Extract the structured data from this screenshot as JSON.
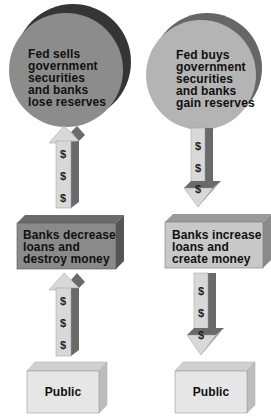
{
  "diagram": {
    "title": "",
    "colors": {
      "left_disc_face": "#8c8c8c",
      "left_disc_rim": "#353535",
      "right_disc_face": "#b4b4b4",
      "right_disc_rim": "#666666",
      "left_box_face": "#8a8a8a",
      "left_box_top": "#6a6a6a",
      "left_box_side": "#555555",
      "right_box_face": "#c8c8c8",
      "right_box_top": "#9a9a9a",
      "right_box_side": "#8a8a8a",
      "public_face": "#e6e6e6",
      "public_top": "#d0d0d0",
      "public_side": "#bdbdbd",
      "arrow_face": "#d4d4d4",
      "arrow_side": "#6a6a6a"
    },
    "left_column": {
      "top": {
        "shape": "disc",
        "lines": [
          "Fed sells",
          "government",
          "securities",
          "and banks",
          "lose reserves"
        ]
      },
      "upper_arrow": {
        "direction": "up",
        "symbols": [
          "$",
          "$",
          "$"
        ]
      },
      "middle": {
        "shape": "box",
        "lines": [
          "Banks decrease",
          "loans and",
          "destroy money"
        ]
      },
      "lower_arrow": {
        "direction": "up",
        "symbols": [
          "$",
          "$",
          "$"
        ]
      },
      "bottom": {
        "shape": "box",
        "label": "Public"
      }
    },
    "right_column": {
      "top": {
        "shape": "disc",
        "lines": [
          "Fed buys",
          "government",
          "securities",
          "and banks",
          "gain reserves"
        ]
      },
      "upper_arrow": {
        "direction": "down",
        "symbols": [
          "$",
          "$",
          "$"
        ]
      },
      "middle": {
        "shape": "box",
        "lines": [
          "Banks increase",
          "loans and",
          "create money"
        ]
      },
      "lower_arrow": {
        "direction": "down",
        "symbols": [
          "$",
          "$",
          "$"
        ]
      },
      "bottom": {
        "shape": "box",
        "label": "Public"
      }
    }
  }
}
